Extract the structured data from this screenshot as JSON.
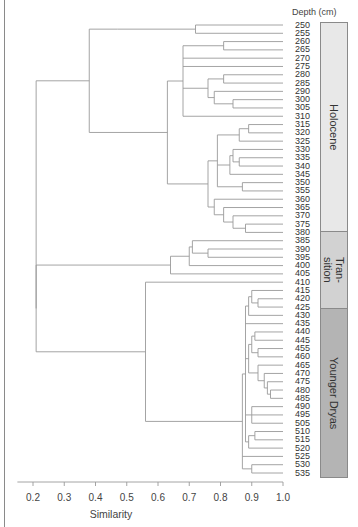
{
  "chart_data": {
    "type": "dendrogram",
    "title": "",
    "xlabel": "Similarity",
    "ylabel": "Depth (cm)",
    "xlim": [
      0.15,
      1.0
    ],
    "x_ticks": [
      "0.2",
      "0.3",
      "0.4",
      "0.5",
      "0.6",
      "0.7",
      "0.8",
      "0.9",
      "1.0"
    ],
    "x_tick_values": [
      0.2,
      0.3,
      0.4,
      0.5,
      0.6,
      0.7,
      0.8,
      0.9,
      1.0
    ],
    "leaves": [
      "250",
      "255",
      "260",
      "265",
      "270",
      "275",
      "280",
      "285",
      "290",
      "300",
      "305",
      "310",
      "315",
      "320",
      "325",
      "330",
      "335",
      "340",
      "345",
      "350",
      "355",
      "360",
      "365",
      "370",
      "375",
      "380",
      "385",
      "390",
      "395",
      "400",
      "405",
      "410",
      "415",
      "420",
      "425",
      "430",
      "435",
      "440",
      "445",
      "455",
      "460",
      "465",
      "470",
      "475",
      "480",
      "485",
      "490",
      "495",
      "505",
      "510",
      "515",
      "520",
      "525",
      "530",
      "535"
    ],
    "zones": [
      {
        "name": "Holocene",
        "from": "250",
        "to": "380",
        "color": "#e8e8e8"
      },
      {
        "name": "Tran-\nsition",
        "from": "385",
        "to": "405",
        "color": "#d2d2d2"
      },
      {
        "name": "Younger Dryas",
        "from": "410",
        "to": "535",
        "color": "#b4b4b4"
      }
    ],
    "major_merges": [
      {
        "clusters": [
          "Holocene",
          "Transition+YD"
        ],
        "similarity": 0.21
      },
      {
        "clusters": [
          "Transition",
          "Younger Dryas"
        ],
        "similarity": 0.21
      },
      {
        "clusters": [
          "250-255",
          "260-380"
        ],
        "similarity": 0.38
      },
      {
        "clusters": [
          "Transition group",
          "380"
        ],
        "similarity": 0.64
      },
      {
        "clusters": [
          "Younger Dryas core",
          "410"
        ],
        "similarity": 0.56
      }
    ],
    "grid": false,
    "legend": "none"
  },
  "header": {
    "depth_label": "Depth (cm)"
  },
  "axis": {
    "title": "Similarity"
  },
  "zones_display": [
    {
      "label": "Holocene"
    },
    {
      "label": "Tran-\nsition"
    },
    {
      "label": "Younger Dryas"
    }
  ]
}
